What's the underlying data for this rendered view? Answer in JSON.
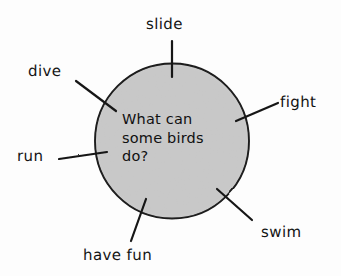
{
  "diagram": {
    "type": "word-web",
    "center": {
      "label": "What can some birds do?",
      "lines": [
        "What can",
        "some birds",
        "do?"
      ],
      "shape": "circle",
      "fill_color": "#c9c9c9",
      "stroke_color": "#1a1a1a",
      "cx": 172,
      "cy": 141,
      "r": 77
    },
    "branches": [
      {
        "id": "slide",
        "label": "slide",
        "position": "top",
        "label_x": 170,
        "label_y": 25,
        "spoke": {
          "x1": 172,
          "y1": 41,
          "x2": 172,
          "y2": 77
        }
      },
      {
        "id": "dive",
        "label": "dive",
        "position": "upper-left",
        "label_x": 49,
        "label_y": 72,
        "spoke": {
          "x1": 76,
          "y1": 81,
          "x2": 116,
          "y2": 111
        }
      },
      {
        "id": "fight",
        "label": "fight",
        "position": "upper-right",
        "label_x": 304,
        "label_y": 103,
        "spoke": {
          "x1": 236,
          "y1": 121,
          "x2": 278,
          "y2": 103
        }
      },
      {
        "id": "run",
        "label": "run",
        "position": "left",
        "label_x": 37,
        "label_y": 157,
        "spoke": {
          "x1": 59,
          "y1": 159,
          "x2": 107,
          "y2": 152
        }
      },
      {
        "id": "swim",
        "label": "swim",
        "position": "lower-right",
        "label_x": 289,
        "label_y": 233,
        "spoke": {
          "x1": 217,
          "y1": 189,
          "x2": 252,
          "y2": 220
        }
      },
      {
        "id": "have-fun",
        "label": "have fun",
        "position": "bottom",
        "label_x": 129,
        "label_y": 256,
        "spoke": {
          "x1": 146,
          "y1": 199,
          "x2": 131,
          "y2": 241
        }
      }
    ]
  }
}
